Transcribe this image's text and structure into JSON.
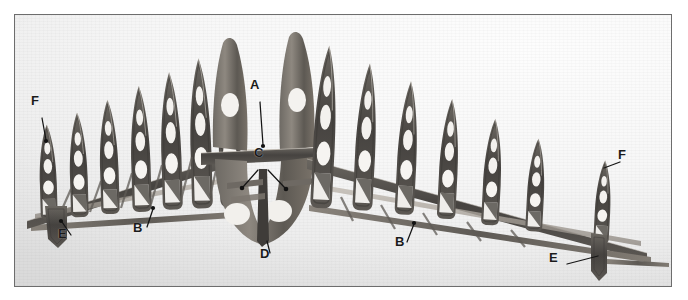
{
  "figure": {
    "kind": "photograph",
    "frame": {
      "border_color": "#6d6d6d",
      "x": 14,
      "y": 14,
      "width": 656,
      "height": 271
    },
    "background": {
      "light": "#fdfdfd",
      "mid": "#f0f0f0",
      "dark": "#e4e4e4"
    },
    "structure_color_dark": "#4a4643",
    "structure_color_mid": "#7d7872",
    "structure_color_light": "#b9b3ab"
  },
  "callouts": [
    {
      "id": "F-left",
      "label": "F",
      "x": 36,
      "y": 102,
      "leader": [
        [
          41,
          117
        ],
        [
          44,
          137
        ]
      ]
    },
    {
      "id": "A",
      "label": "A",
      "x": 254,
      "y": 86,
      "leader": [
        [
          259,
          100
        ],
        [
          262,
          143
        ]
      ]
    },
    {
      "id": "C",
      "label": "C",
      "x": 258,
      "y": 154,
      "leader": [
        [
          258,
          168
        ],
        [
          243,
          185
        ]
      ]
    },
    {
      "id": "C2",
      "label": "",
      "x": 0,
      "y": 0,
      "leader": [
        [
          266,
          168
        ],
        [
          283,
          186
        ]
      ]
    },
    {
      "id": "B-left",
      "label": "B",
      "x": 137,
      "y": 228,
      "leader": [
        [
          146,
          224
        ],
        [
          152,
          207
        ]
      ]
    },
    {
      "id": "E-left",
      "label": "E",
      "x": 62,
      "y": 234,
      "leader": [
        [
          70,
          232
        ],
        [
          60,
          219
        ]
      ]
    },
    {
      "id": "D",
      "label": "D",
      "x": 264,
      "y": 254,
      "leader": [
        [
          269,
          252
        ],
        [
          266,
          238
        ]
      ]
    },
    {
      "id": "B-right",
      "label": "B",
      "x": 399,
      "y": 242,
      "leader": [
        [
          406,
          239
        ],
        [
          412,
          221
        ]
      ]
    },
    {
      "id": "E-right",
      "label": "E",
      "x": 553,
      "y": 258,
      "leader": [
        [
          564,
          262
        ],
        [
          596,
          253
        ]
      ]
    },
    {
      "id": "F-right",
      "label": "F",
      "x": 622,
      "y": 155,
      "leader": [
        [
          620,
          162
        ],
        [
          602,
          168
        ]
      ]
    }
  ],
  "left_wing": {
    "rib_count": 7,
    "ribs": [
      {
        "x": 44,
        "base_y": 214,
        "h": 92,
        "tilt": -2
      },
      {
        "x": 73,
        "base_y": 209,
        "h": 104,
        "tilt": -2
      },
      {
        "x": 104,
        "base_y": 205,
        "h": 116,
        "tilt": -2
      },
      {
        "x": 134,
        "base_y": 201,
        "h": 128,
        "tilt": -2
      },
      {
        "x": 164,
        "base_y": 196,
        "h": 140,
        "tilt": -2
      },
      {
        "x": 193,
        "base_y": 192,
        "h": 152,
        "tilt": -2
      },
      {
        "x": 222,
        "base_y": 188,
        "h": 163,
        "tilt": -2
      }
    ]
  },
  "right_wing": {
    "rib_count": 7,
    "ribs": [
      {
        "x": 320,
        "base_y": 190,
        "h": 160,
        "tilt": 3
      },
      {
        "x": 358,
        "base_y": 196,
        "h": 144,
        "tilt": 3
      },
      {
        "x": 396,
        "base_y": 202,
        "h": 128,
        "tilt": 3
      },
      {
        "x": 438,
        "base_y": 209,
        "h": 112,
        "tilt": 3
      },
      {
        "x": 480,
        "base_y": 216,
        "h": 96,
        "tilt": 3
      },
      {
        "x": 525,
        "base_y": 223,
        "h": 80,
        "tilt": 3
      },
      {
        "x": 600,
        "base_y": 238,
        "h": 68,
        "tilt": 3
      }
    ]
  }
}
